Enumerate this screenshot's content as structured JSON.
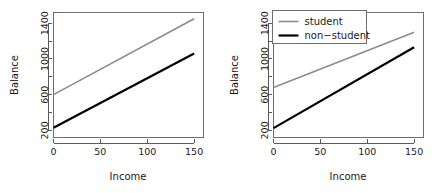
{
  "figure": {
    "background": "#ffffff",
    "panel_count": 2
  },
  "colors": {
    "student": "#8c8c8c",
    "non_student": "#000000",
    "axis": "#5a5a5a",
    "frame": "#6e6e6e",
    "text": "#1a1a1a",
    "background": "#ffffff"
  },
  "chart_data": [
    {
      "id": "left-panel",
      "type": "line",
      "title": "",
      "xlabel": "Income",
      "ylabel": "Balance",
      "xlim": [
        0,
        160
      ],
      "ylim": [
        120,
        1520
      ],
      "grid": false,
      "legend": null,
      "xticks": [
        0,
        50,
        100,
        150
      ],
      "xtick_labels": [
        "0",
        "50",
        "100",
        "150"
      ],
      "yticks": [
        200,
        400,
        600,
        800,
        1000,
        1200,
        1400
      ],
      "ytick_labels": [
        "200",
        "",
        "600",
        "",
        "1000",
        "",
        "1400"
      ],
      "ytick_labels_shown": [
        "200",
        "600",
        "1000",
        "1400"
      ],
      "x": [
        0,
        150
      ],
      "series": [
        {
          "name": "student",
          "color": "#8c8c8c",
          "width": 1.6,
          "values": [
            600,
            1450
          ]
        },
        {
          "name": "non-student",
          "color": "#000000",
          "width": 2.2,
          "values": [
            230,
            1060
          ]
        }
      ]
    },
    {
      "id": "right-panel",
      "type": "line",
      "title": "",
      "xlabel": "Income",
      "ylabel": "Balance",
      "xlim": [
        0,
        160
      ],
      "ylim": [
        120,
        1520
      ],
      "grid": false,
      "legend": {
        "position": "top-left",
        "entries": [
          {
            "label": "student",
            "color": "#8c8c8c",
            "width": 1.6
          },
          {
            "label": "non-student",
            "color": "#000000",
            "width": 2.2
          }
        ]
      },
      "xticks": [
        0,
        50,
        100,
        150
      ],
      "xtick_labels": [
        "0",
        "50",
        "100",
        "150"
      ],
      "yticks": [
        200,
        400,
        600,
        800,
        1000,
        1200,
        1400
      ],
      "ytick_labels": [
        "200",
        "",
        "600",
        "",
        "1000",
        "",
        "1400"
      ],
      "ytick_labels_shown": [
        "200",
        "600",
        "1000",
        "1400"
      ],
      "x": [
        0,
        150
      ],
      "series": [
        {
          "name": "student",
          "color": "#8c8c8c",
          "width": 1.6,
          "values": [
            680,
            1300
          ]
        },
        {
          "name": "non-student",
          "color": "#000000",
          "width": 2.2,
          "values": [
            225,
            1130
          ]
        }
      ]
    }
  ]
}
